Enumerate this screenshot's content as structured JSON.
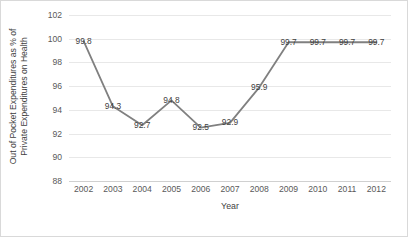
{
  "chart_data": {
    "type": "line",
    "title": "",
    "xlabel": "Year",
    "ylabel": "Out of Pocket Expenditures as % of Private Expenditures on Health",
    "ylabel_line1": "Out of Pocket Expenditures as % of",
    "ylabel_line2": "Private Expenditures on Health",
    "categories": [
      "2002",
      "2003",
      "2004",
      "2005",
      "2006",
      "2007",
      "2008",
      "2009",
      "2010",
      "2011",
      "2012"
    ],
    "values": [
      99.8,
      94.3,
      92.7,
      94.8,
      92.5,
      92.9,
      95.9,
      99.7,
      99.7,
      99.7,
      99.7
    ],
    "data_labels": [
      "99.8",
      "94.3",
      "92.7",
      "94.8",
      "92.5",
      "92.9",
      "95.9",
      "99.7",
      "99.7",
      "99.7",
      "99.7"
    ],
    "ylim": [
      88,
      102
    ],
    "ytick_values": [
      102,
      100,
      98,
      96,
      94,
      92,
      90,
      88
    ],
    "ytick_labels": [
      "102",
      "100",
      "98",
      "96",
      "94",
      "92",
      "90",
      "88"
    ],
    "grid": true,
    "grid_axis": "y",
    "legend": false,
    "legend_position": "none",
    "series_color": "#808080",
    "gridline_color": "#e8e8e8",
    "text_color": "#3f3f3f",
    "background": "#ffffff",
    "border_color": "#d9d9d9"
  }
}
